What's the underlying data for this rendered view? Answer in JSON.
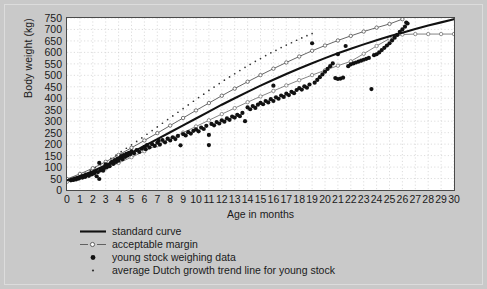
{
  "chart_data": {
    "type": "scatter",
    "title": "",
    "xlabel": "Age in months",
    "ylabel": "Body weight (kg)",
    "xlim": [
      0,
      30
    ],
    "ylim": [
      0,
      750
    ],
    "grid": true,
    "legend_position": "below-plot-left",
    "x_ticks": [
      0,
      1,
      2,
      3,
      4,
      5,
      6,
      7,
      8,
      9,
      10,
      11,
      12,
      13,
      14,
      15,
      16,
      17,
      18,
      19,
      20,
      21,
      22,
      23,
      24,
      25,
      26,
      27,
      28,
      29,
      30
    ],
    "y_ticks": [
      0,
      50,
      100,
      150,
      200,
      250,
      300,
      350,
      400,
      450,
      500,
      550,
      600,
      650,
      700,
      750
    ],
    "legend": [
      {
        "label": "standard curve",
        "marker": "solid-line",
        "color": "#111111"
      },
      {
        "label": "acceptable margin",
        "marker": "dashed-line-open-circle",
        "color": "#555555"
      },
      {
        "label": "young stock weighing data",
        "marker": "filled-circle",
        "color": "#111111"
      },
      {
        "label": "average Dutch growth trend line for young stock",
        "marker": "small-dot",
        "color": "#333333"
      }
    ],
    "series": [
      {
        "name": "standard curve",
        "type": "line",
        "color": "#111111",
        "points": [
          [
            0,
            42
          ],
          [
            1,
            60
          ],
          [
            2,
            82
          ],
          [
            3,
            108
          ],
          [
            4,
            135
          ],
          [
            5,
            163
          ],
          [
            6,
            192
          ],
          [
            7,
            222
          ],
          [
            8,
            252
          ],
          [
            9,
            282
          ],
          [
            10,
            312
          ],
          [
            11,
            342
          ],
          [
            12,
            372
          ],
          [
            13,
            400
          ],
          [
            14,
            428
          ],
          [
            15,
            455
          ],
          [
            16,
            481
          ],
          [
            17,
            506
          ],
          [
            18,
            530
          ],
          [
            19,
            553
          ],
          [
            20,
            575
          ],
          [
            21,
            596
          ],
          [
            22,
            616
          ],
          [
            23,
            635
          ],
          [
            24,
            653
          ],
          [
            25,
            670
          ],
          [
            26,
            686
          ],
          [
            27,
            702
          ],
          [
            28,
            717
          ],
          [
            29,
            731
          ],
          [
            30,
            745
          ]
        ]
      },
      {
        "name": "acceptable margin upper",
        "type": "line-markers",
        "color": "#555555",
        "points": [
          [
            0,
            48
          ],
          [
            1,
            70
          ],
          [
            2,
            95
          ],
          [
            3,
            123
          ],
          [
            4,
            153
          ],
          [
            5,
            184
          ],
          [
            6,
            216
          ],
          [
            7,
            248
          ],
          [
            8,
            281
          ],
          [
            9,
            314
          ],
          [
            10,
            347
          ],
          [
            11,
            379
          ],
          [
            12,
            411
          ],
          [
            13,
            442
          ],
          [
            14,
            472
          ],
          [
            15,
            501
          ],
          [
            16,
            529
          ],
          [
            17,
            556
          ],
          [
            18,
            582
          ],
          [
            19,
            607
          ],
          [
            20,
            630
          ],
          [
            21,
            652
          ],
          [
            22,
            672
          ],
          [
            23,
            691
          ],
          [
            24,
            708
          ],
          [
            25,
            724
          ],
          [
            26,
            745
          ]
        ]
      },
      {
        "name": "acceptable margin lower",
        "type": "line-markers",
        "color": "#777777",
        "points": [
          [
            0,
            36
          ],
          [
            1,
            52
          ],
          [
            2,
            71
          ],
          [
            3,
            94
          ],
          [
            4,
            118
          ],
          [
            5,
            143
          ],
          [
            6,
            169
          ],
          [
            7,
            196
          ],
          [
            8,
            223
          ],
          [
            9,
            250
          ],
          [
            10,
            277
          ],
          [
            11,
            304
          ],
          [
            12,
            331
          ],
          [
            13,
            357
          ],
          [
            14,
            383
          ],
          [
            15,
            408
          ],
          [
            16,
            432
          ],
          [
            17,
            456
          ],
          [
            18,
            479
          ],
          [
            19,
            501
          ],
          [
            20,
            522
          ],
          [
            21,
            542
          ],
          [
            22,
            561
          ],
          [
            23,
            594
          ],
          [
            24,
            628
          ],
          [
            25,
            660
          ],
          [
            26,
            678
          ],
          [
            27,
            680
          ],
          [
            28,
            680
          ],
          [
            29,
            680
          ],
          [
            30,
            680
          ]
        ]
      },
      {
        "name": "average Dutch growth trend line for young stock",
        "type": "dots",
        "color": "#333333",
        "points": [
          [
            0.2,
            45
          ],
          [
            0.6,
            55
          ],
          [
            1.0,
            64
          ],
          [
            1.4,
            74
          ],
          [
            1.8,
            86
          ],
          [
            2.2,
            98
          ],
          [
            2.6,
            110
          ],
          [
            3.0,
            124
          ],
          [
            3.4,
            138
          ],
          [
            3.8,
            152
          ],
          [
            4.2,
            167
          ],
          [
            4.6,
            182
          ],
          [
            5.0,
            197
          ],
          [
            5.4,
            212
          ],
          [
            5.8,
            227
          ],
          [
            6.2,
            243
          ],
          [
            6.6,
            259
          ],
          [
            7.0,
            275
          ],
          [
            7.4,
            291
          ],
          [
            7.8,
            307
          ],
          [
            8.2,
            323
          ],
          [
            8.6,
            339
          ],
          [
            9.0,
            355
          ],
          [
            9.4,
            371
          ],
          [
            9.8,
            387
          ],
          [
            10.2,
            403
          ],
          [
            10.6,
            418
          ],
          [
            11.0,
            434
          ],
          [
            11.4,
            449
          ],
          [
            11.8,
            464
          ],
          [
            12.2,
            479
          ],
          [
            12.6,
            493
          ],
          [
            13.0,
            507
          ],
          [
            13.4,
            521
          ],
          [
            13.8,
            535
          ],
          [
            14.2,
            548
          ],
          [
            14.6,
            561
          ],
          [
            15.0,
            573
          ],
          [
            15.4,
            586
          ],
          [
            15.8,
            598
          ],
          [
            16.2,
            609
          ],
          [
            16.6,
            621
          ],
          [
            17.0,
            632
          ],
          [
            17.4,
            642
          ],
          [
            17.8,
            653
          ],
          [
            18.2,
            663
          ],
          [
            18.6,
            673
          ],
          [
            19.0,
            682
          ]
        ]
      },
      {
        "name": "young stock weighing data",
        "type": "scatter",
        "color": "#111111",
        "points": [
          [
            0.3,
            42
          ],
          [
            0.4,
            45
          ],
          [
            0.5,
            44
          ],
          [
            0.6,
            48
          ],
          [
            0.7,
            46
          ],
          [
            0.8,
            52
          ],
          [
            0.9,
            50
          ],
          [
            1.0,
            55
          ],
          [
            1.1,
            58
          ],
          [
            1.2,
            54
          ],
          [
            1.3,
            60
          ],
          [
            1.4,
            57
          ],
          [
            1.5,
            63
          ],
          [
            1.6,
            66
          ],
          [
            1.7,
            62
          ],
          [
            1.8,
            70
          ],
          [
            1.9,
            68
          ],
          [
            2.0,
            74
          ],
          [
            2.1,
            72
          ],
          [
            2.2,
            80
          ],
          [
            2.3,
            60
          ],
          [
            2.4,
            78
          ],
          [
            2.5,
            48
          ],
          [
            2.5,
            118
          ],
          [
            2.6,
            86
          ],
          [
            2.7,
            90
          ],
          [
            2.8,
            84
          ],
          [
            2.9,
            96
          ],
          [
            3.0,
            112
          ],
          [
            3.1,
            100
          ],
          [
            3.2,
            108
          ],
          [
            3.3,
            104
          ],
          [
            3.4,
            118
          ],
          [
            3.5,
            124
          ],
          [
            3.6,
            114
          ],
          [
            3.7,
            130
          ],
          [
            3.8,
            122
          ],
          [
            3.9,
            136
          ],
          [
            4.0,
            128
          ],
          [
            4.1,
            140
          ],
          [
            4.2,
            148
          ],
          [
            4.3,
            134
          ],
          [
            4.4,
            152
          ],
          [
            4.5,
            144
          ],
          [
            4.6,
            158
          ],
          [
            4.7,
            150
          ],
          [
            4.8,
            162
          ],
          [
            4.9,
            156
          ],
          [
            5.0,
            168
          ],
          [
            5.2,
            160
          ],
          [
            5.4,
            174
          ],
          [
            5.6,
            166
          ],
          [
            5.8,
            180
          ],
          [
            6.0,
            188
          ],
          [
            6.1,
            178
          ],
          [
            6.2,
            196
          ],
          [
            6.4,
            186
          ],
          [
            6.6,
            200
          ],
          [
            6.8,
            192
          ],
          [
            7.0,
            206
          ],
          [
            7.1,
            214
          ],
          [
            7.2,
            198
          ],
          [
            7.4,
            218
          ],
          [
            7.6,
            208
          ],
          [
            7.8,
            224
          ],
          [
            8.0,
            216
          ],
          [
            8.2,
            230
          ],
          [
            8.4,
            222
          ],
          [
            8.6,
            236
          ],
          [
            8.8,
            195
          ],
          [
            9.0,
            244
          ],
          [
            9.2,
            238
          ],
          [
            9.4,
            252
          ],
          [
            9.6,
            246
          ],
          [
            9.8,
            258
          ],
          [
            10.0,
            264
          ],
          [
            10.2,
            256
          ],
          [
            10.4,
            272
          ],
          [
            10.6,
            266
          ],
          [
            10.8,
            280
          ],
          [
            11.0,
            240
          ],
          [
            11.0,
            196
          ],
          [
            11.2,
            288
          ],
          [
            11.4,
            282
          ],
          [
            11.6,
            296
          ],
          [
            11.8,
            290
          ],
          [
            12.0,
            304
          ],
          [
            12.2,
            298
          ],
          [
            12.4,
            312
          ],
          [
            12.6,
            306
          ],
          [
            12.8,
            320
          ],
          [
            13.0,
            316
          ],
          [
            13.2,
            328
          ],
          [
            13.4,
            322
          ],
          [
            13.6,
            336
          ],
          [
            13.8,
            300
          ],
          [
            14.0,
            360
          ],
          [
            14.2,
            352
          ],
          [
            14.4,
            366
          ],
          [
            14.6,
            358
          ],
          [
            14.8,
            372
          ],
          [
            15.0,
            380
          ],
          [
            15.2,
            374
          ],
          [
            15.4,
            388
          ],
          [
            15.6,
            382
          ],
          [
            15.8,
            396
          ],
          [
            16.0,
            455
          ],
          [
            16.0,
            388
          ],
          [
            16.2,
            404
          ],
          [
            16.4,
            398
          ],
          [
            16.6,
            412
          ],
          [
            16.8,
            406
          ],
          [
            17.0,
            420
          ],
          [
            17.2,
            414
          ],
          [
            17.4,
            428
          ],
          [
            17.6,
            422
          ],
          [
            17.8,
            436
          ],
          [
            18.0,
            444
          ],
          [
            18.2,
            438
          ],
          [
            18.4,
            452
          ],
          [
            18.6,
            446
          ],
          [
            18.8,
            460
          ],
          [
            19.0,
            640
          ],
          [
            19.2,
            468
          ],
          [
            19.4,
            480
          ],
          [
            19.6,
            492
          ],
          [
            19.8,
            504
          ],
          [
            20.0,
            516
          ],
          [
            20.2,
            528
          ],
          [
            20.4,
            540
          ],
          [
            20.6,
            552
          ],
          [
            20.8,
            488
          ],
          [
            21.0,
            592
          ],
          [
            21.0,
            484
          ],
          [
            21.2,
            486
          ],
          [
            21.4,
            490
          ],
          [
            21.6,
            628
          ],
          [
            21.8,
            540
          ],
          [
            22.0,
            548
          ],
          [
            22.2,
            552
          ],
          [
            22.4,
            556
          ],
          [
            22.6,
            560
          ],
          [
            22.8,
            564
          ],
          [
            23.0,
            568
          ],
          [
            23.2,
            572
          ],
          [
            23.4,
            576
          ],
          [
            23.6,
            440
          ],
          [
            23.8,
            588
          ],
          [
            24.0,
            592
          ],
          [
            24.2,
            600
          ],
          [
            24.4,
            610
          ],
          [
            24.6,
            620
          ],
          [
            24.8,
            630
          ],
          [
            25.0,
            640
          ],
          [
            25.2,
            652
          ],
          [
            25.4,
            664
          ],
          [
            25.6,
            676
          ],
          [
            25.8,
            690
          ],
          [
            26.0,
            700
          ],
          [
            26.2,
            712
          ],
          [
            26.3,
            730
          ],
          [
            26.4,
            726
          ]
        ]
      }
    ]
  }
}
